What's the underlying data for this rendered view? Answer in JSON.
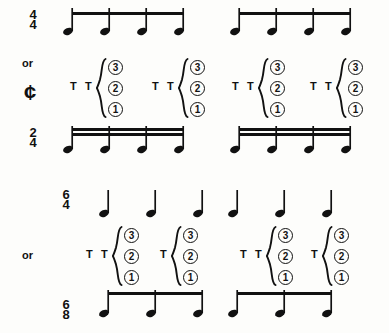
{
  "figure": {
    "background_color": "#fdfdfb",
    "ink_color": "#111111"
  },
  "labels": {
    "or": "or",
    "cut_time_symbol": "¢",
    "tongue_mark": "T",
    "finger_3": "3",
    "finger_2": "2",
    "finger_1": "1"
  },
  "rows": [
    {
      "id": "row-4-4",
      "label_type": "timesig",
      "numerator": "4",
      "denominator": "4",
      "label_x": 22,
      "label_y": 10,
      "notes_y": 30,
      "beam_y": 12,
      "beam_count": 1,
      "measures": [
        {
          "x_positions": [
            68,
            105,
            142,
            179
          ],
          "beam_from": 68,
          "beam_to": 179
        },
        {
          "x_positions": [
            235,
            272,
            309,
            346
          ],
          "beam_from": 235,
          "beam_to": 346
        }
      ]
    },
    {
      "id": "row-or-cut",
      "label_type": "cut",
      "or_x": 22,
      "or_y": 58,
      "cut_x": 24,
      "cut_y": 82,
      "groups": [
        {
          "t_marks": [
            70,
            85
          ],
          "brace_x": 96,
          "circles_x": 108,
          "top_y": 60
        },
        {
          "t_marks": [
            152,
            167
          ],
          "brace_x": 178,
          "circles_x": 190,
          "top_y": 60
        },
        {
          "t_marks": [
            232,
            247
          ],
          "brace_x": 258,
          "circles_x": 270,
          "top_y": 60
        },
        {
          "t_marks": [
            310,
            325
          ],
          "brace_x": 336,
          "circles_x": 348,
          "top_y": 60
        }
      ]
    },
    {
      "id": "row-2-4",
      "label_type": "timesig",
      "numerator": "2",
      "denominator": "4",
      "label_x": 22,
      "label_y": 128,
      "notes_y": 148,
      "beam_y": 128,
      "beam_count": 2,
      "measures": [
        {
          "x_positions": [
            68,
            105,
            142,
            179
          ],
          "beam_from": 68,
          "beam_to": 179
        },
        {
          "x_positions": [
            235,
            272,
            309,
            346
          ],
          "beam_from": 235,
          "beam_to": 346
        }
      ]
    },
    {
      "id": "row-6-4",
      "label_type": "timesig",
      "numerator": "6",
      "denominator": "4",
      "label_x": 55,
      "label_y": 190,
      "notes_y": 212,
      "beam_y": null,
      "beam_count": 0,
      "measures": [
        {
          "x_positions": [
            104,
            151,
            198
          ],
          "beam_from": null,
          "beam_to": null
        },
        {
          "x_positions": [
            233,
            280,
            327
          ],
          "beam_from": null,
          "beam_to": null
        }
      ]
    },
    {
      "id": "row-or-lower",
      "label_type": "or",
      "or_x": 22,
      "or_y": 250,
      "groups": [
        {
          "t_marks": [
            86,
            101
          ],
          "brace_x": 112,
          "circles_x": 124,
          "top_y": 228
        },
        {
          "t_marks": [
            160
          ],
          "brace_x": 171,
          "circles_x": 183,
          "top_y": 228
        },
        {
          "t_marks": [
            240,
            255
          ],
          "brace_x": 266,
          "circles_x": 278,
          "top_y": 228
        },
        {
          "t_marks": [
            311
          ],
          "brace_x": 322,
          "circles_x": 334,
          "top_y": 228
        }
      ]
    },
    {
      "id": "row-6-8",
      "label_type": "timesig",
      "numerator": "6",
      "denominator": "8",
      "label_x": 55,
      "label_y": 300,
      "notes_y": 312,
      "beam_y": 292,
      "beam_count": 1,
      "measures": [
        {
          "x_positions": [
            104,
            151,
            198
          ],
          "beam_from": 104,
          "beam_to": 198
        },
        {
          "x_positions": [
            233,
            280,
            327
          ],
          "beam_from": 233,
          "beam_to": 327
        }
      ]
    }
  ]
}
